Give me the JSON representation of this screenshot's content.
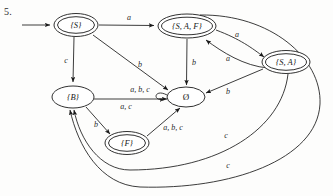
{
  "figure": {
    "problem_number": "5.",
    "caption": "",
    "type": "finite-state-automaton-diagram"
  },
  "states": [
    {
      "id": "S",
      "label": "{S}",
      "accepting": true,
      "start": true,
      "cx": 76,
      "cy": 25,
      "rx": 22,
      "ry": 11
    },
    {
      "id": "SAF",
      "label": "{S, A, F}",
      "accepting": true,
      "start": false,
      "cx": 187,
      "cy": 26,
      "rx": 29,
      "ry": 12
    },
    {
      "id": "SA",
      "label": "{S, A}",
      "accepting": true,
      "start": false,
      "cx": 286,
      "cy": 62,
      "rx": 24,
      "ry": 11
    },
    {
      "id": "B",
      "label": "{B}",
      "accepting": false,
      "start": false,
      "cx": 73,
      "cy": 97,
      "rx": 21,
      "ry": 11
    },
    {
      "id": "EMPTY",
      "label": "Ø",
      "accepting": false,
      "start": false,
      "cx": 186,
      "cy": 97,
      "rx": 19,
      "ry": 10
    },
    {
      "id": "F",
      "label": "{F}",
      "accepting": true,
      "start": false,
      "cx": 127,
      "cy": 143,
      "rx": 22,
      "ry": 11
    }
  ],
  "transitions": [
    {
      "from": "start",
      "to": "S",
      "label": ""
    },
    {
      "from": "S",
      "to": "SAF",
      "label": "a"
    },
    {
      "from": "S",
      "to": "B",
      "label": "c"
    },
    {
      "from": "S",
      "to": "EMPTY",
      "label": "b"
    },
    {
      "from": "SAF",
      "to": "EMPTY",
      "label": "b"
    },
    {
      "from": "SAF",
      "to": "SA",
      "label": "a"
    },
    {
      "from": "SA",
      "to": "SAF",
      "label": "a"
    },
    {
      "from": "SA",
      "to": "EMPTY",
      "label": "b"
    },
    {
      "from": "SA",
      "to": "B",
      "label": "c"
    },
    {
      "from": "SAF",
      "to": "B",
      "label": "c"
    },
    {
      "from": "B",
      "to": "EMPTY",
      "label": "a, c"
    },
    {
      "from": "B",
      "to": "F",
      "label": "b"
    },
    {
      "from": "F",
      "to": "EMPTY",
      "label": "a, b, c"
    },
    {
      "from": "EMPTY",
      "to": "EMPTY",
      "label": "a, b, c"
    }
  ],
  "edge_labels": [
    {
      "name": "label-s-to-saf",
      "text": "a",
      "x": 129,
      "y": 17
    },
    {
      "name": "label-s-to-b",
      "text": "c",
      "x": 66,
      "y": 60
    },
    {
      "name": "label-s-to-empty",
      "text": "b",
      "x": 140,
      "y": 64
    },
    {
      "name": "label-saf-to-empty",
      "text": "b",
      "x": 194,
      "y": 62
    },
    {
      "name": "label-saf-to-sa",
      "text": "a",
      "x": 237,
      "y": 34
    },
    {
      "name": "label-sa-to-saf",
      "text": "a",
      "x": 228,
      "y": 58
    },
    {
      "name": "label-sa-to-empty",
      "text": "b",
      "x": 228,
      "y": 91
    },
    {
      "name": "label-empty-selfloop",
      "text": "a, b, c",
      "x": 140,
      "y": 89
    },
    {
      "name": "label-b-to-empty",
      "text": "a, c",
      "x": 126,
      "y": 106
    },
    {
      "name": "label-b-to-f",
      "text": "b",
      "x": 96,
      "y": 124
    },
    {
      "name": "label-f-to-empty",
      "text": "a, b, c",
      "x": 173,
      "y": 127
    },
    {
      "name": "label-sa-to-b-c",
      "text": "c",
      "x": 226,
      "y": 135
    },
    {
      "name": "label-saf-to-b-c",
      "text": "c",
      "x": 228,
      "y": 165
    }
  ],
  "colors": {
    "stroke": "#1a1a1a",
    "text": "#191919",
    "background": "#fdfdfc"
  }
}
